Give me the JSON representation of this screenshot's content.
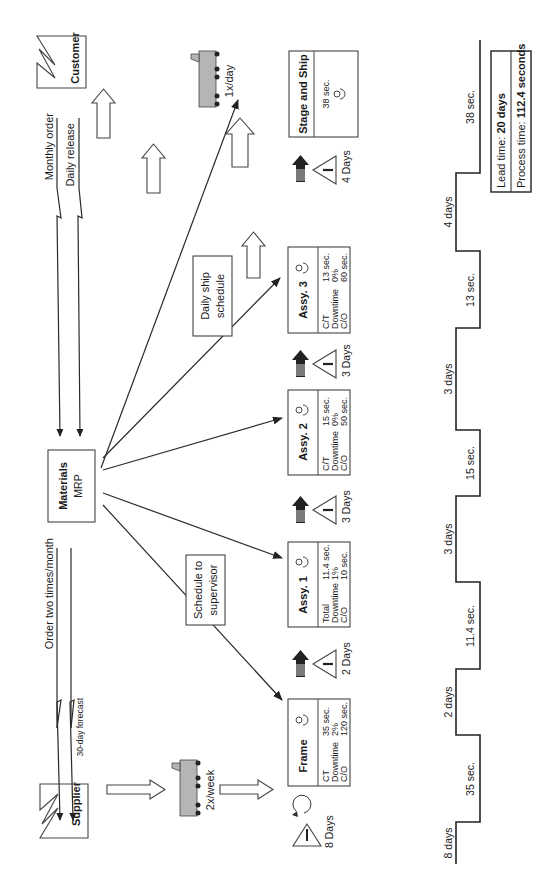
{
  "diagram": {
    "type": "value-stream-map",
    "orientation": "rotated-90-ccw"
  },
  "customer": {
    "label": "Customer"
  },
  "supplier": {
    "label": "Supplier"
  },
  "control": {
    "title": "Materials",
    "subtitle": "MRP",
    "to_supplier_label": "Order two times/month",
    "forecast_label": "30-day forecast",
    "from_customer_order": "Monthly order",
    "from_customer_release": "Daily release",
    "schedule_box": "Schedule to supervisor",
    "schedule_box_line1": "Schedule to",
    "schedule_box_line2": "supervisor",
    "ship_box_line1": "Daily ship",
    "ship_box_line2": "schedule"
  },
  "shipments": {
    "inbound": "2x/week",
    "outbound": "1x/day"
  },
  "processes": [
    {
      "name": "Frame",
      "rows": [
        {
          "label": "CT",
          "value": "35 sec."
        },
        {
          "label": "Downtime",
          "value": "2%"
        },
        {
          "label": "C/O",
          "value": "120 sec."
        }
      ]
    },
    {
      "name": "Assy. 1",
      "rows": [
        {
          "label": "Total",
          "value": "11.4 sec."
        },
        {
          "label": "Downtime",
          "value": "1%"
        },
        {
          "label": "C/O",
          "value": "10 sec."
        }
      ]
    },
    {
      "name": "Assy. 2",
      "rows": [
        {
          "label": "C/T",
          "value": "15 sec."
        },
        {
          "label": "Downtime",
          "value": "0%"
        },
        {
          "label": "C/O",
          "value": "50 sec."
        }
      ]
    },
    {
      "name": "Assy. 3",
      "rows": [
        {
          "label": "C/T",
          "value": "13 sec."
        },
        {
          "label": "Downtime",
          "value": "0%"
        },
        {
          "label": "C/O",
          "value": "60 sec."
        }
      ]
    },
    {
      "name": "Stage and Ship",
      "rows": [
        {
          "label": "",
          "value": "38 sec."
        }
      ]
    }
  ],
  "inventory": [
    {
      "symbol": "I",
      "label": "8 Days"
    },
    {
      "symbol": "I",
      "label": "2 Days"
    },
    {
      "symbol": "I",
      "label": "3 Days"
    },
    {
      "symbol": "I",
      "label": "3 Days"
    },
    {
      "symbol": "I",
      "label": "4 Days"
    }
  ],
  "timeline": {
    "wait": [
      "8 days",
      "2 days",
      "3 days",
      "3 days",
      "4 days"
    ],
    "process": [
      "35 sec.",
      "11.4 sec.",
      "15 sec.",
      "13 sec.",
      "38 sec."
    ]
  },
  "summary": {
    "lead_label": "Lead time: ",
    "lead_value": "20 days",
    "process_label": "Process time: ",
    "process_value": "112.4 seconds"
  },
  "icons": {
    "operator": "operator-icon",
    "push": "push-arrow-icon",
    "inventory": "inventory-triangle-icon",
    "truck": "truck-icon",
    "factory": "factory-icon",
    "cycle": "circular-arrow-icon"
  }
}
